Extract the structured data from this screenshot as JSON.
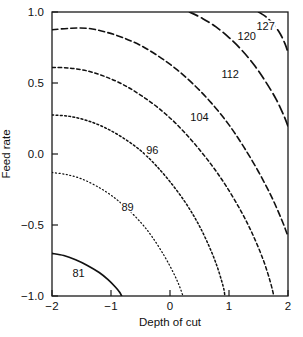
{
  "chart_data": {
    "type": "contour",
    "title": "",
    "xlabel": "Depth of cut",
    "ylabel": "Feed rate",
    "xlim": [
      -2,
      2
    ],
    "ylim": [
      -1.0,
      1.0
    ],
    "xticks": [
      "-2",
      "-1",
      "0",
      "1",
      "2"
    ],
    "xtick_values": [
      -2,
      -1,
      0,
      1,
      2
    ],
    "yticks": [
      "1.0",
      "0.5",
      "0.0",
      "-0.5",
      "-1.0"
    ],
    "ytick_values": [
      1.0,
      0.5,
      0.0,
      -0.5,
      -1.0
    ],
    "grid": false,
    "legend": "none",
    "contour_levels": [
      81,
      89,
      96,
      104,
      112,
      120,
      127
    ],
    "contours": [
      {
        "level": "81",
        "value": 81,
        "line_style": "solid",
        "label_x": -1.55,
        "label_y": -0.84,
        "points": [
          [
            -2.0,
            -0.7
          ],
          [
            -1.8,
            -0.715
          ],
          [
            -1.6,
            -0.745
          ],
          [
            -1.4,
            -0.785
          ],
          [
            -1.2,
            -0.835
          ],
          [
            -1.05,
            -0.885
          ],
          [
            -0.93,
            -0.935
          ],
          [
            -0.85,
            -0.975
          ],
          [
            -0.82,
            -1.0
          ]
        ]
      },
      {
        "level": "89",
        "value": 89,
        "line_style": "fine-dotted",
        "label_x": -0.72,
        "label_y": -0.37,
        "points": [
          [
            -2.0,
            -0.13
          ],
          [
            -1.75,
            -0.145
          ],
          [
            -1.5,
            -0.175
          ],
          [
            -1.25,
            -0.225
          ],
          [
            -1.0,
            -0.29
          ],
          [
            -0.75,
            -0.375
          ],
          [
            -0.5,
            -0.48
          ],
          [
            -0.3,
            -0.585
          ],
          [
            -0.1,
            -0.715
          ],
          [
            0.05,
            -0.83
          ],
          [
            0.15,
            -0.92
          ],
          [
            0.22,
            -1.0
          ]
        ]
      },
      {
        "level": "96",
        "value": 96,
        "line_style": "dotted",
        "label_x": -0.3,
        "label_y": 0.03,
        "points": [
          [
            -2.0,
            0.275
          ],
          [
            -1.7,
            0.265
          ],
          [
            -1.4,
            0.235
          ],
          [
            -1.1,
            0.185
          ],
          [
            -0.8,
            0.115
          ],
          [
            -0.5,
            0.025
          ],
          [
            -0.25,
            -0.075
          ],
          [
            0.0,
            -0.195
          ],
          [
            0.25,
            -0.335
          ],
          [
            0.45,
            -0.47
          ],
          [
            0.62,
            -0.61
          ],
          [
            0.78,
            -0.77
          ],
          [
            0.9,
            -0.93
          ],
          [
            0.93,
            -1.0
          ]
        ]
      },
      {
        "level": "104",
        "value": 104,
        "line_style": "short-dash",
        "label_x": 0.5,
        "label_y": 0.26,
        "points": [
          [
            -2.0,
            0.61
          ],
          [
            -1.7,
            0.605
          ],
          [
            -1.4,
            0.585
          ],
          [
            -1.1,
            0.545
          ],
          [
            -0.8,
            0.49
          ],
          [
            -0.5,
            0.415
          ],
          [
            -0.2,
            0.325
          ],
          [
            0.1,
            0.215
          ],
          [
            0.4,
            0.08
          ],
          [
            0.7,
            -0.075
          ],
          [
            0.95,
            -0.225
          ],
          [
            1.2,
            -0.4
          ],
          [
            1.4,
            -0.565
          ],
          [
            1.58,
            -0.745
          ],
          [
            1.7,
            -0.9
          ],
          [
            1.76,
            -1.0
          ]
        ]
      },
      {
        "level": "112",
        "value": 112,
        "line_style": "medium-dash",
        "label_x": 1.02,
        "label_y": 0.565,
        "points": [
          [
            -2.0,
            0.875
          ],
          [
            -1.7,
            0.885
          ],
          [
            -1.4,
            0.885
          ],
          [
            -1.1,
            0.86
          ],
          [
            -0.8,
            0.82
          ],
          [
            -0.5,
            0.765
          ],
          [
            -0.2,
            0.69
          ],
          [
            0.1,
            0.6
          ],
          [
            0.4,
            0.49
          ],
          [
            0.7,
            0.36
          ],
          [
            1.0,
            0.205
          ],
          [
            1.25,
            0.05
          ],
          [
            1.5,
            -0.125
          ],
          [
            1.72,
            -0.3
          ],
          [
            1.9,
            -0.47
          ],
          [
            2.0,
            -0.58
          ]
        ]
      },
      {
        "level": "120",
        "value": 120,
        "line_style": "long-dash",
        "label_x": 1.3,
        "label_y": 0.83,
        "points": [
          [
            0.33,
            1.0
          ],
          [
            0.55,
            0.955
          ],
          [
            0.78,
            0.895
          ],
          [
            1.0,
            0.82
          ],
          [
            1.22,
            0.73
          ],
          [
            1.43,
            0.625
          ],
          [
            1.62,
            0.51
          ],
          [
            1.8,
            0.385
          ],
          [
            1.93,
            0.27
          ],
          [
            2.0,
            0.195
          ]
        ]
      },
      {
        "level": "127",
        "value": 127,
        "line_style": "long-dash",
        "label_x": 1.62,
        "label_y": 0.9,
        "points": [
          [
            1.5,
            1.0
          ],
          [
            1.63,
            0.965
          ],
          [
            1.76,
            0.91
          ],
          [
            1.87,
            0.845
          ],
          [
            1.95,
            0.775
          ],
          [
            2.0,
            0.715
          ]
        ]
      }
    ]
  }
}
